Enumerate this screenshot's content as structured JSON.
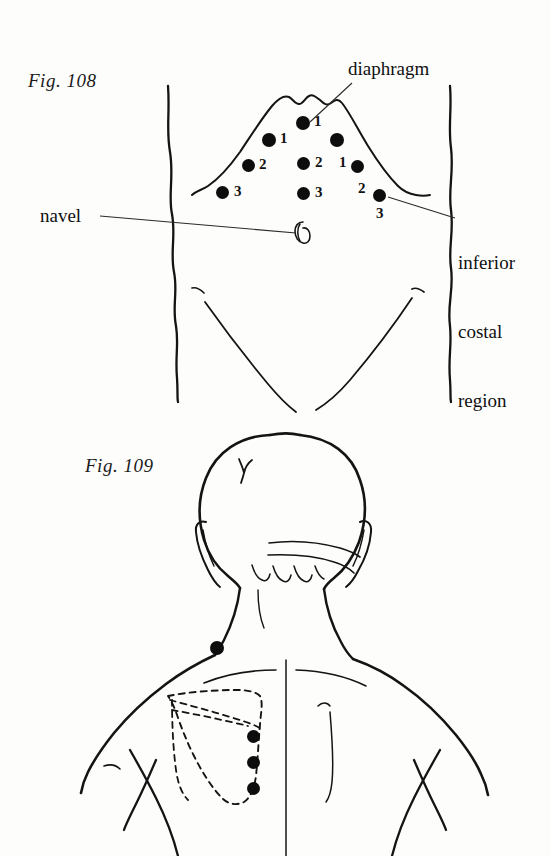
{
  "page": {
    "background_color": "#fdfdfc",
    "ink_color": "#141414",
    "dot_color": "#0d0d0d",
    "width": 551,
    "height": 856
  },
  "figures": [
    {
      "id": "fig-108",
      "label": "Fig. 108",
      "view": "anterior abdomen",
      "annotations": [
        {
          "name": "diaphragm",
          "text": "diaphragm"
        },
        {
          "name": "navel",
          "text": "navel"
        },
        {
          "name": "inferior-costal-region",
          "lines": [
            "inferior",
            "costal",
            "region"
          ]
        }
      ],
      "point_labels": {
        "one": "1",
        "two": "2",
        "three": "3"
      },
      "points": [
        {
          "id": "p-top-1",
          "label": "1",
          "x": 303,
          "y": 123,
          "r": 7,
          "lx": 314,
          "ly": 115
        },
        {
          "id": "p-left-1",
          "label": "1",
          "x": 269,
          "y": 140,
          "r": 7,
          "lx": 280,
          "ly": 132
        },
        {
          "id": "p-right-u",
          "label": "",
          "x": 337,
          "y": 140,
          "r": 7,
          "lx": 0,
          "ly": 0
        },
        {
          "id": "p-left-2",
          "label": "2",
          "x": 249,
          "y": 166,
          "r": 6.5,
          "lx": 260,
          "ly": 158
        },
        {
          "id": "p-mid-2",
          "label": "2",
          "x": 304,
          "y": 163,
          "r": 6.5,
          "lx": 316,
          "ly": 155
        },
        {
          "id": "p-right-1",
          "label": "1",
          "x": 358,
          "y": 166,
          "r": 6.5,
          "lx": 340,
          "ly": 155
        },
        {
          "id": "p-left-3",
          "label": "3",
          "x": 223,
          "y": 192,
          "r": 6.5,
          "lx": 235,
          "ly": 184
        },
        {
          "id": "p-mid-3",
          "label": "3",
          "x": 304,
          "y": 193,
          "r": 6.5,
          "lx": 316,
          "ly": 185
        },
        {
          "id": "p-right-2",
          "label": "2",
          "x": 379,
          "y": 193,
          "r": 6.5,
          "lx": 361,
          "ly": 183
        },
        {
          "id": "p-right-3",
          "label": "3",
          "x": 381,
          "y": 196,
          "r": 0,
          "lx": 378,
          "ly": 206
        }
      ]
    },
    {
      "id": "fig-109",
      "label": "Fig. 109",
      "view": "posterior head neck upper back",
      "points": [
        {
          "id": "p-neck",
          "x": 217,
          "y": 648,
          "r": 7
        },
        {
          "id": "p-scap-1",
          "x": 254,
          "y": 737,
          "r": 6.5
        },
        {
          "id": "p-scap-2",
          "x": 254,
          "y": 762,
          "r": 6.5
        },
        {
          "id": "p-scap-3",
          "x": 254,
          "y": 788,
          "r": 6.5
        }
      ]
    }
  ]
}
